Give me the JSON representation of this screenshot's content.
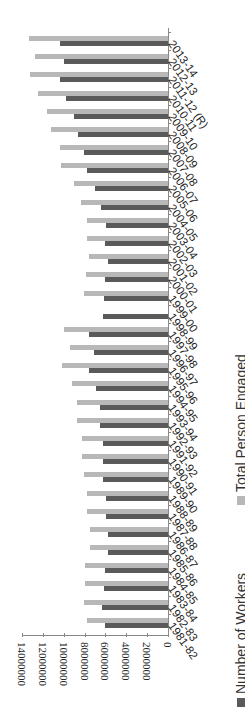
{
  "chart_data": {
    "type": "bar",
    "orientation": "horizontal-rotated",
    "title": "",
    "xlabel": "",
    "ylabel": "",
    "categories": [
      "1981-82",
      "1982-83",
      "1983-84",
      "1984-85",
      "1985-86",
      "1986-87",
      "1987-88",
      "1988-89",
      "1989-90",
      "1990-91",
      "1991-92",
      "1992-93",
      "1993-94",
      "1994-95",
      "1995-96",
      "1996-97",
      "1997-98",
      "1998-99",
      "1999-00",
      "2000-01",
      "2001-02",
      "2002-03",
      "2003-04",
      "2004-05",
      "2005-06",
      "2006-07",
      "2007-08",
      "2008-09",
      "2009-10",
      "2010-11",
      "2011-12 (R)",
      "2012-13",
      "2013-14"
    ],
    "series": [
      {
        "name": "Number of Workers",
        "color": "#5a5a5a",
        "values": [
          6000000,
          6300000,
          6100000,
          6000000,
          5800000,
          5800000,
          5900000,
          5900000,
          6200000,
          6200000,
          6200000,
          6500000,
          6500000,
          6900000,
          7600000,
          7100000,
          7600000,
          6200000,
          6100000,
          6000000,
          5800000,
          6000000,
          5900000,
          6400000,
          7000000,
          7800000,
          8100000,
          8600000,
          9000000,
          9800000,
          10400000,
          10000000,
          10400000
        ]
      },
      {
        "name": "Total Person Engaged",
        "color": "#b8b8b8",
        "values": [
          7800000,
          8100000,
          8000000,
          8000000,
          7500000,
          7500000,
          7800000,
          7800000,
          8100000,
          8200000,
          8200000,
          8700000,
          8700000,
          9200000,
          10200000,
          9400000,
          10000000,
          null,
          8100000,
          7900000,
          7600000,
          7800000,
          7800000,
          8300000,
          9000000,
          10300000,
          10400000,
          11200000,
          11600000,
          12500000,
          13200000,
          12800000,
          13300000
        ]
      }
    ],
    "axis_ticks": [
      "0",
      "2000000",
      "4000000",
      "6000000",
      "8000000",
      "10000000",
      "12000000",
      "14000000"
    ],
    "ylim": [
      0,
      14000000
    ],
    "grid": false,
    "legend_position": "bottom"
  },
  "legend": {
    "workers": "Number of Workers",
    "total": "Total Person Engaged"
  }
}
